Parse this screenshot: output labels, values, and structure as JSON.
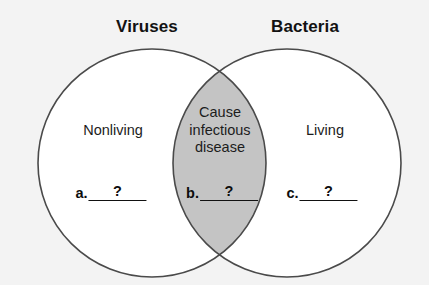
{
  "figure": {
    "type": "venn-diagram",
    "background_color": "#f3f3f3",
    "circle_stroke_color": "#4a4a4a",
    "circle_fill_color": "#ffffff",
    "overlap_fill_color": "#c4c4c4",
    "text_color": "#1c1c1c"
  },
  "titles": {
    "left": "Viruses",
    "right": "Bacteria"
  },
  "regions": {
    "left_only": "Nonliving",
    "right_only": "Living",
    "overlap_lines": [
      "Cause",
      "infectious",
      "disease"
    ],
    "overlap_text": "Cause infectious disease"
  },
  "blanks": [
    {
      "letter": "a.",
      "value": "?"
    },
    {
      "letter": "b.",
      "value": "?"
    },
    {
      "letter": "c.",
      "value": "?"
    }
  ],
  "geometry": {
    "left_circle": {
      "cx": 152,
      "cy": 163,
      "r": 114
    },
    "right_circle": {
      "cx": 287,
      "cy": 163,
      "r": 114
    }
  }
}
